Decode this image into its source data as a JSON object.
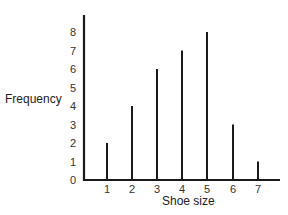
{
  "chart_data": {
    "type": "bar",
    "title": "",
    "xlabel": "Shoe size",
    "ylabel": "Frequency",
    "categories": [
      "1",
      "2",
      "3",
      "4",
      "5",
      "6",
      "7"
    ],
    "values": [
      2,
      4,
      6,
      7,
      8,
      3,
      1
    ],
    "ylim": [
      0,
      8
    ],
    "yticks": [
      "0",
      "1",
      "2",
      "3",
      "4",
      "5",
      "6",
      "7",
      "8"
    ],
    "grid": false,
    "legend": null,
    "style": "vertical line (stick) chart",
    "bar_color": "#1a1a1a"
  }
}
